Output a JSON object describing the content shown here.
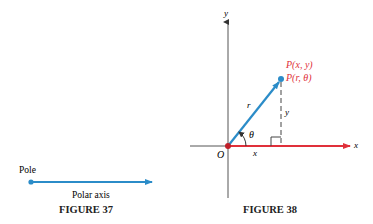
{
  "figure37": {
    "caption": "FIGURE 37",
    "pole_label": "Pole",
    "axis_label": "Polar axis",
    "colors": {
      "axis": "#2b8cc8"
    }
  },
  "figure38": {
    "caption": "FIGURE 38",
    "x_axis_label": "x",
    "y_axis_label": "y",
    "origin_label": "O",
    "point_label_cartesian": "P(x, y)",
    "point_label_polar": "P(r, θ)",
    "r_label": "r",
    "theta_label": "θ",
    "x_segment_label": "x",
    "y_segment_label": "y",
    "colors": {
      "radius": "#2b8cc8",
      "polar_axis": "#e0303a",
      "point_label": "#e0303a",
      "axes": "#444444"
    }
  }
}
